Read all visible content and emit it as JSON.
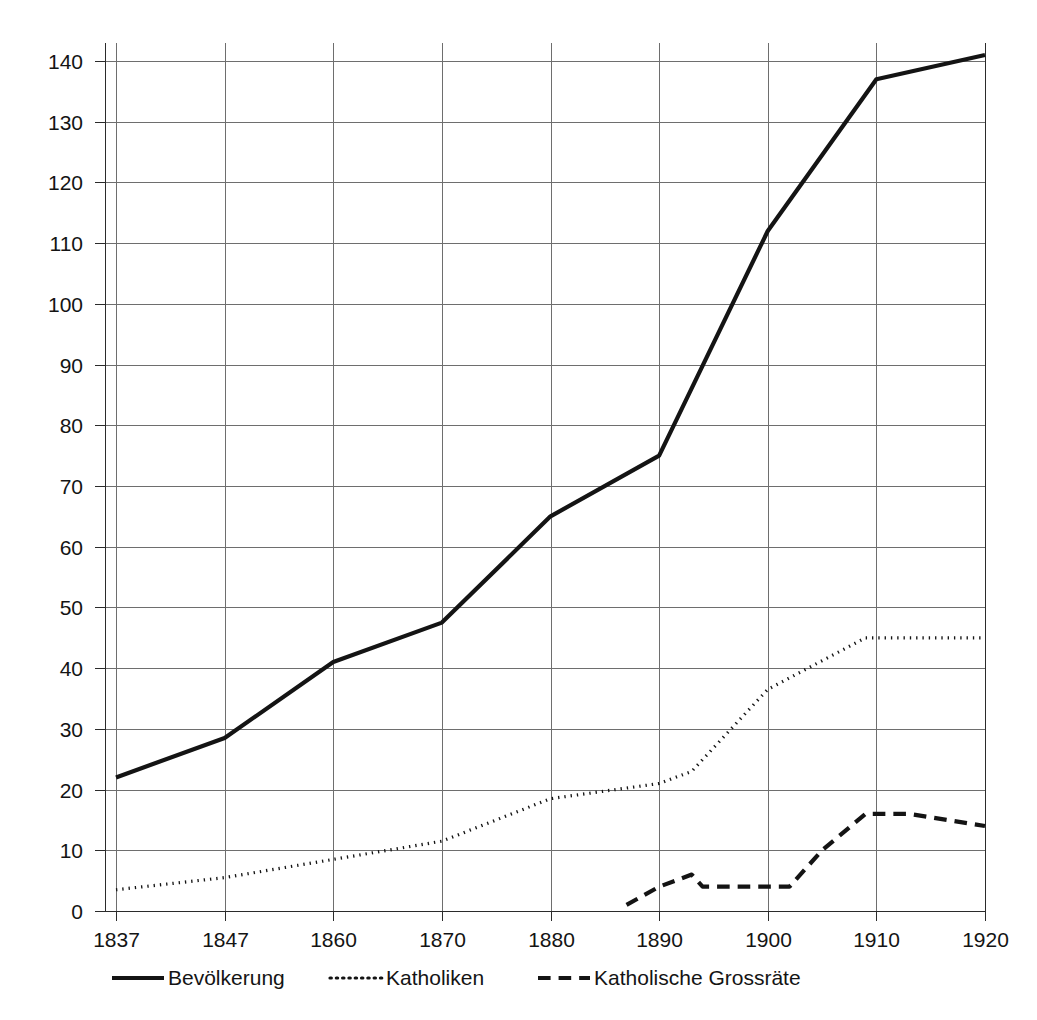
{
  "figure": {
    "background_color": "#ffffff",
    "line_color": "#141414",
    "grid_color": "#6e6e6e"
  },
  "chart_data": {
    "type": "line",
    "title": "",
    "subtitle": "",
    "xlabel": "",
    "ylabel": "",
    "xlim": [
      1837,
      1920
    ],
    "ylim": [
      0,
      140
    ],
    "grid": true,
    "legend_position": "bottom",
    "x_tick_labels": [
      "1837",
      "1847",
      "1860",
      "1870",
      "1880",
      "1890",
      "1900",
      "1910",
      "1920"
    ],
    "x_tick_values": [
      1837,
      1847,
      1860,
      1870,
      1880,
      1890,
      1900,
      1910,
      1920
    ],
    "y_tick_labels": [
      "0",
      "10",
      "20",
      "30",
      "40",
      "50",
      "60",
      "70",
      "80",
      "90",
      "100",
      "110",
      "120",
      "130",
      "140"
    ],
    "y_tick_values": [
      0,
      10,
      20,
      30,
      40,
      50,
      60,
      70,
      80,
      90,
      100,
      110,
      120,
      130,
      140
    ],
    "categories": [
      1837,
      1847,
      1860,
      1870,
      1880,
      1890,
      1900,
      1910,
      1920
    ],
    "series": [
      {
        "name": "Bevölkerung",
        "style": "solid",
        "color": "#141414",
        "width": 4.2,
        "x": [
          1837,
          1847,
          1860,
          1870,
          1880,
          1890,
          1900,
          1910,
          1920
        ],
        "values": [
          22,
          28.5,
          41,
          47.5,
          65,
          75,
          112,
          137,
          141
        ]
      },
      {
        "name": "Katholiken",
        "style": "dotted",
        "color": "#141414",
        "width": 3.2,
        "x": [
          1837,
          1847,
          1860,
          1870,
          1880,
          1890,
          1893,
          1900,
          1909,
          1920
        ],
        "values": [
          3.5,
          5.5,
          8.5,
          11.5,
          18.5,
          21,
          23,
          36.5,
          45,
          45
        ]
      },
      {
        "name": "Katholische Grossräte",
        "style": "dashed",
        "color": "#141414",
        "width": 4.2,
        "x": [
          1887,
          1890,
          1893,
          1894,
          1902,
          1905,
          1909,
          1913,
          1920
        ],
        "values": [
          1,
          4,
          6,
          4,
          4,
          10,
          16,
          16,
          14
        ]
      }
    ]
  },
  "legend": {
    "items": [
      {
        "label": "Bevölkerung",
        "style": "solid"
      },
      {
        "label": "Katholiken",
        "style": "dotted"
      },
      {
        "label": "Katholische Grossräte",
        "style": "dashed"
      }
    ]
  }
}
